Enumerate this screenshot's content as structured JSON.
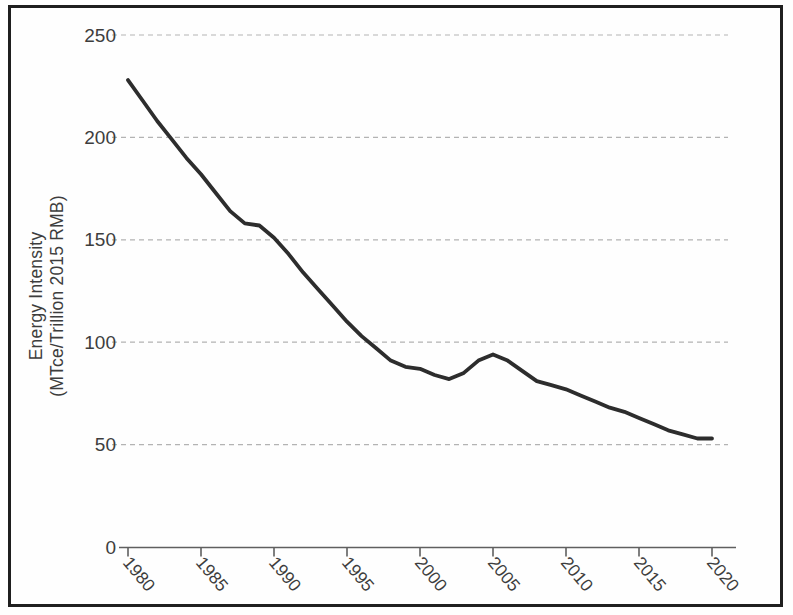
{
  "figure": {
    "background": "#fefefe",
    "frame_color": "#1f1f1f"
  },
  "chart_data": {
    "type": "line",
    "title": "",
    "xlabel": "",
    "ylabel_line1": "Energy Intensity",
    "ylabel_line2": "(MTce/Trillion 2015 RMB)",
    "x": [
      1980,
      1981,
      1982,
      1983,
      1984,
      1985,
      1986,
      1987,
      1988,
      1989,
      1990,
      1991,
      1992,
      1993,
      1994,
      1995,
      1996,
      1997,
      1998,
      1999,
      2000,
      2001,
      2002,
      2003,
      2004,
      2005,
      2006,
      2007,
      2008,
      2009,
      2010,
      2011,
      2012,
      2013,
      2014,
      2015,
      2016,
      2017,
      2018,
      2019,
      2020
    ],
    "series": [
      {
        "name": "energy-intensity",
        "color": "#2d2d2d",
        "values": [
          228,
          218,
          208,
          199,
          190,
          182,
          173,
          164,
          158,
          157,
          151,
          143,
          134,
          126,
          118,
          110,
          103,
          97,
          91,
          88,
          87,
          84,
          82,
          85,
          91,
          94,
          91,
          86,
          81,
          79,
          77,
          74,
          71,
          68,
          66,
          63,
          60,
          57,
          55,
          53,
          53
        ]
      }
    ],
    "yticks": [
      0,
      50,
      100,
      150,
      200,
      250
    ],
    "xticks": [
      1980,
      1985,
      1990,
      1995,
      2000,
      2005,
      2010,
      2015,
      2020
    ],
    "ylim": [
      0,
      250
    ],
    "xlim": [
      1980,
      2020
    ],
    "grid": "horizontal-dashed",
    "legend": "none",
    "grid_color": "#b3b3b3",
    "axis_color": "#5f5f5f",
    "tick_label_color": "#3d3d3d"
  }
}
